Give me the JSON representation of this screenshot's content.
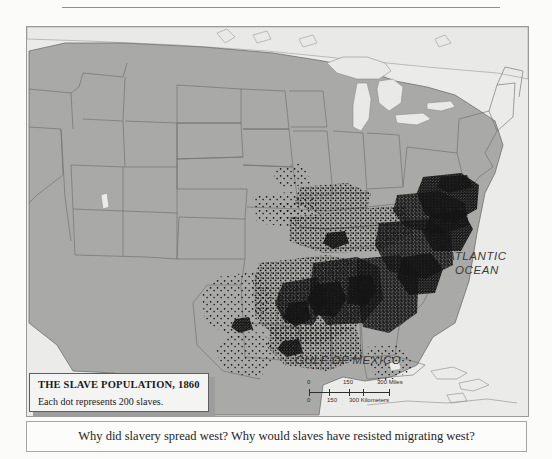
{
  "map": {
    "title": "THE SLAVE POPULATION, 1860",
    "subtitle": "Each dot represents 200 slaves.",
    "ocean_labels": {
      "atlantic": "ATLANTIC OCEAN",
      "atlantic_line1": "ATLANTIC",
      "atlantic_line2": "OCEAN",
      "gulf": "GULF OF MEXICO"
    },
    "scale": {
      "miles": {
        "t0": "0",
        "t150": "150",
        "t300": "300 Miles"
      },
      "kilometers": {
        "t0": "0",
        "t150": "150",
        "t300": "300 Kilometers"
      }
    },
    "colors": {
      "land": "#a9a9a7",
      "water": "#e9e9e7",
      "page": "#fbfbfa",
      "border": "#6e6e6e",
      "dot": "#141414",
      "legend_bg": "#f4f4f2",
      "legend_shadow": "#9d9d9d"
    }
  },
  "caption": {
    "text": "Why did slavery spread west? Why would slaves have resisted migrating west?"
  }
}
